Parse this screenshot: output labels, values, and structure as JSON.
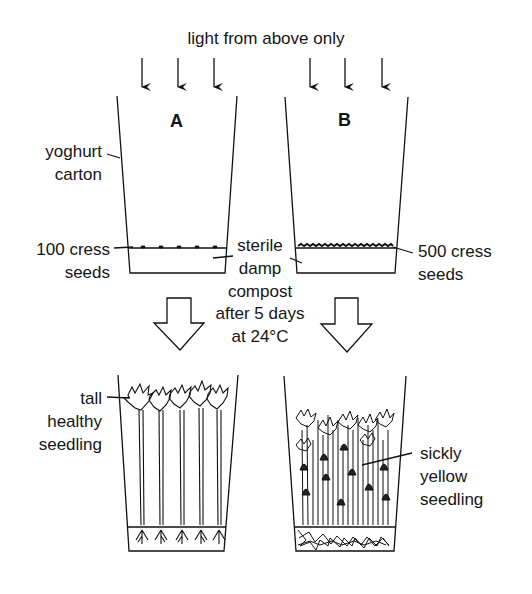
{
  "title": "light from above only",
  "cartons": [
    {
      "label": "A",
      "seeds": "100 cress seeds",
      "result": "tall healthy seedling"
    },
    {
      "label": "B",
      "seeds": "500 cress seeds",
      "result": "sickly yellow seedling"
    }
  ],
  "labels": {
    "carton_line1": "yoghurt",
    "carton_line2": "carton",
    "seedsA_line1": "100 cress",
    "seedsA_line2": "seeds",
    "seedsB_line1": "500 cress",
    "seedsB_line2": "seeds",
    "compost_line1": "sterile",
    "compost_line2": "damp",
    "compost_line3": "compost",
    "condition_line1": "after 5 days",
    "condition_line2": "at 24°C",
    "tall_line1": "tall",
    "tall_line2": "healthy",
    "tall_line3": "seedling",
    "sickly_line1": "sickly",
    "sickly_line2": "yellow",
    "sickly_line3": "seedling"
  }
}
